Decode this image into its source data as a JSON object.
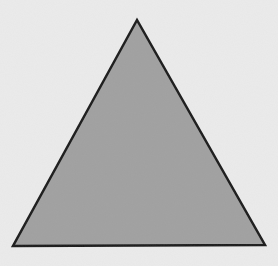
{
  "figure": {
    "shape": "triangle",
    "type": "equilateral",
    "vertices": [
      [
        137,
        20
      ],
      [
        13,
        246
      ],
      [
        265,
        245
      ]
    ],
    "fill_color": "#a0a0a0",
    "stroke_color": "#1a1a1a",
    "stroke_width": 2.5,
    "background_color": "#ebebeb"
  }
}
